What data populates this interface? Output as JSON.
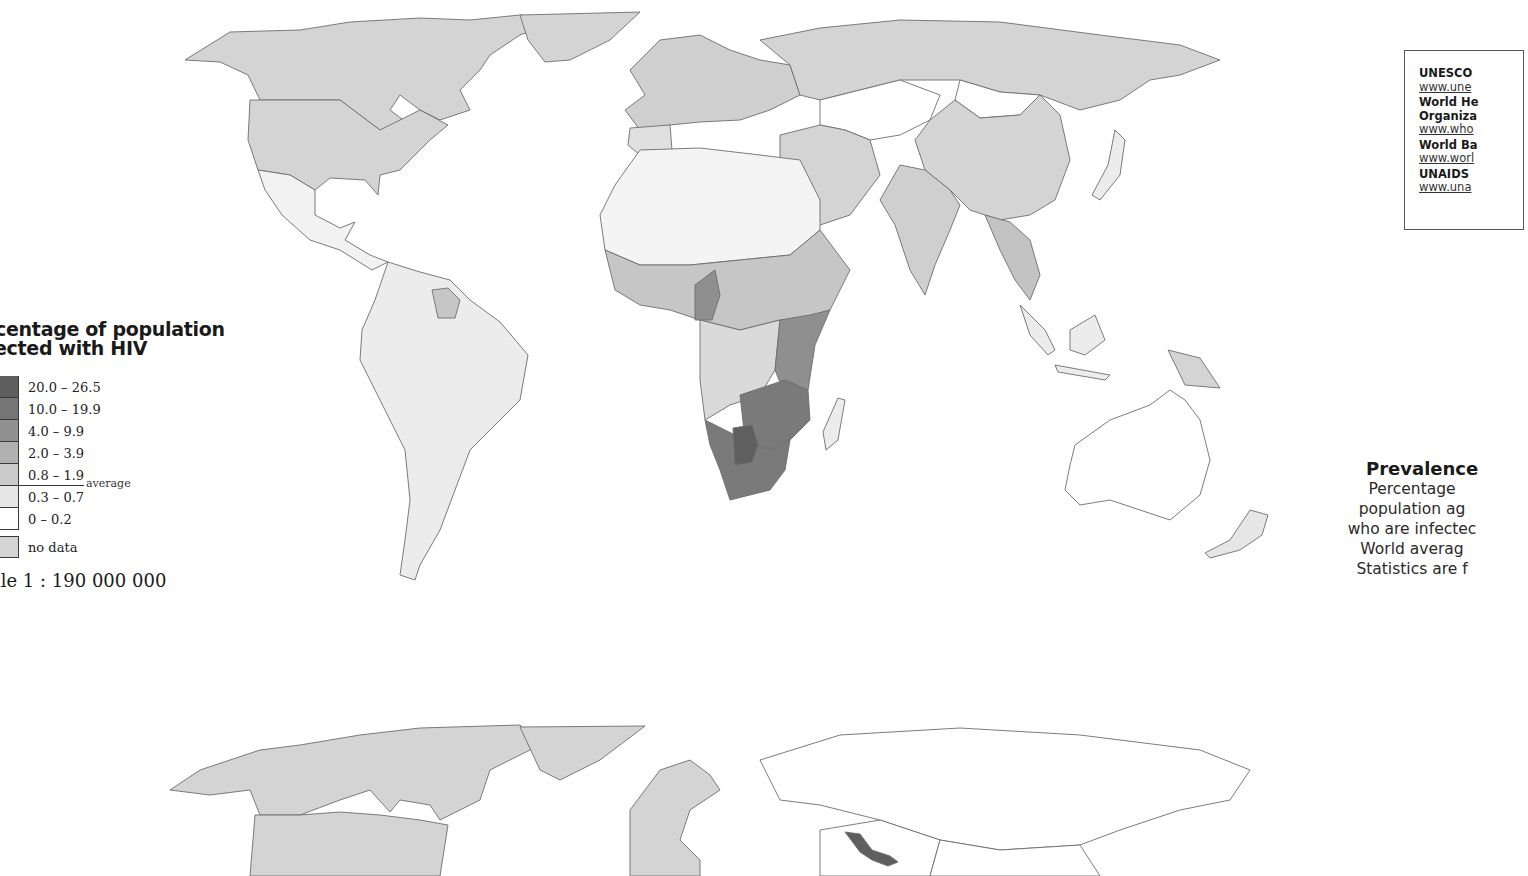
{
  "legend": {
    "title_line1": "rcentage of population",
    "title_line2": "fected with HIV",
    "classes": [
      {
        "label": "20.0 – 26.5",
        "color": "#5e5e5e"
      },
      {
        "label": "10.0 – 19.9",
        "color": "#767676"
      },
      {
        "label": "4.0 – 9.9",
        "color": "#919191"
      },
      {
        "label": "2.0 – 3.9",
        "color": "#b1b1b1"
      },
      {
        "label": "0.8 – 1.9",
        "color": "#cacaca"
      },
      {
        "label": "0.3 – 0.7",
        "color": "#e6e6e6"
      },
      {
        "label": "0 – 0.2",
        "color": "#ffffff"
      }
    ],
    "average_label": "average",
    "no_data": {
      "label": "no data",
      "color": "#d4d4d4"
    },
    "scale": "ale 1 : 190 000 000"
  },
  "sources": [
    {
      "name": "UNESCO",
      "url": "www.une"
    },
    {
      "name": "World He",
      "name2": "Organiza",
      "url": "www.who"
    },
    {
      "name": "World Ba",
      "url": "www.worl"
    },
    {
      "name": "UNAIDS",
      "url": "www.una"
    }
  ],
  "prevalence": {
    "title": "Prevalence",
    "lines": [
      "Percentage",
      "population ag",
      "who are infectec",
      "World averag",
      "Statistics are f"
    ]
  },
  "colors": {
    "nodata": "#d4d4d4",
    "c0": "#ffffff",
    "c1": "#ececec",
    "c2": "#cfcfcf",
    "c3": "#b3b3b3",
    "c4": "#959595",
    "c5": "#7a7a7a",
    "c6": "#606060"
  }
}
